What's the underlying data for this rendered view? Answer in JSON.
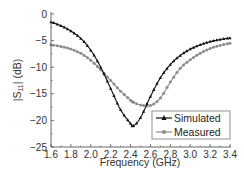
{
  "chart_data": {
    "type": "line",
    "title": "",
    "xlabel": "Frequency (GHz)",
    "ylabel": "|S11| (dB)",
    "ylabel_parts": {
      "prefix": "|S",
      "subscript": "11",
      "suffix": "| (dB)"
    },
    "xlim": [
      1.6,
      3.4
    ],
    "ylim": [
      -25,
      0
    ],
    "xticks": [
      1.6,
      1.8,
      2.0,
      2.2,
      2.4,
      2.6,
      2.8,
      3.0,
      3.2,
      3.4
    ],
    "xtick_labels": [
      "1.6",
      "1.8",
      "2.0",
      "2.2",
      "2.4",
      "2.6",
      "2.8",
      "3.0",
      "3.2",
      "3.4"
    ],
    "yticks": [
      0,
      -5,
      -10,
      -15,
      -20,
      -25
    ],
    "ytick_labels": [
      "0",
      "−5",
      "−10",
      "−15",
      "−20",
      "−25"
    ],
    "grid": false,
    "legend_position": "lower right",
    "x": [
      1.6,
      1.7,
      1.8,
      1.9,
      2.0,
      2.1,
      2.2,
      2.3,
      2.4,
      2.43,
      2.5,
      2.6,
      2.7,
      2.8,
      2.9,
      3.0,
      3.1,
      3.2,
      3.3,
      3.4
    ],
    "series": [
      {
        "name": "Simulated",
        "color": "#111111",
        "marker": "triangle",
        "values": [
          -1.5,
          -2.2,
          -3.2,
          -4.6,
          -6.8,
          -10.0,
          -14.0,
          -18.0,
          -20.6,
          -21.0,
          -19.5,
          -15.5,
          -12.0,
          -9.5,
          -7.8,
          -6.6,
          -5.8,
          -5.2,
          -4.8,
          -4.5
        ]
      },
      {
        "name": "Measured",
        "color": "#8c8c8c",
        "marker": "circle",
        "values": [
          -5.8,
          -6.1,
          -6.6,
          -7.4,
          -8.7,
          -10.5,
          -12.5,
          -14.5,
          -16.2,
          -16.6,
          -17.1,
          -17.2,
          -15.8,
          -12.8,
          -10.2,
          -8.6,
          -7.4,
          -6.5,
          -5.9,
          -5.5
        ]
      }
    ]
  }
}
